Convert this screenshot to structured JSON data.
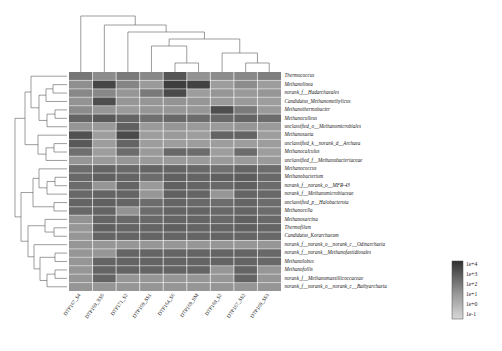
{
  "chart_data": {
    "type": "heatmap",
    "title": "",
    "xlabel": "",
    "ylabel": "",
    "colorscale": {
      "type": "log",
      "low_color": "#d8d8d8",
      "high_color": "#2f2f2f",
      "ticks": [
        "1e+4",
        "1e+3",
        "1e+2",
        "1e+1",
        "1e+0",
        "1e-1"
      ],
      "vmin": 0.1,
      "vmax": 10000
    },
    "legend_position": "bottom-right",
    "grid": true,
    "row_dendrogram": true,
    "column_dendrogram": true,
    "columns": [
      "DTP167_S4",
      "DTP169_XS5",
      "DTP171_S2",
      "DTP169_SS1",
      "DTP164_S6",
      "DTP169_SM",
      "DTP169_S2",
      "DTP167_SS2",
      "DTP169_SS3"
    ],
    "rows": [
      "Thermococcus",
      "Methanolinea",
      "norank_f__Hadarchaeales",
      "Candidatus_Methanomethylicus",
      "Methanothermobacter",
      "Methanoculleus",
      "unclassified_o__Methanomicrobiales",
      "Methanosaeta",
      "unclassified_k__norank_d__Archaea",
      "Methanocalculus",
      "unclassified_f__Methanobacteriaceae",
      "Methanococcus",
      "Methanobacterium",
      "norank_f__norank_o__MFR-43",
      "norank_f__Methanomicrobiaceae",
      "unclassified_p__Halobacterota",
      "Methanocella",
      "Methanosarcina",
      "Thermofilum",
      "Candidatus_Korarchaeum",
      "norank_f__norank_o__norank_c__Odinarchaeia",
      "norank_f__norank__Methanofastidiosales",
      "Methanolobus",
      "Methanofollis",
      "norank_f__Methanomassiliicoccaceae",
      "norank_f__norank_o__norank_c__Bathyarchaeia"
    ],
    "values": [
      [
        2.1,
        1.5,
        2.0,
        1.6,
        3.0,
        1.3,
        1.5,
        1.6,
        1.9
      ],
      [
        1.4,
        3.4,
        1.7,
        1.1,
        3.6,
        3.5,
        1.0,
        1.5,
        1.0
      ],
      [
        1.6,
        1.6,
        1.2,
        2.0,
        3.3,
        1.0,
        1.2,
        1.1,
        1.2
      ],
      [
        1.3,
        3.2,
        1.2,
        1.2,
        1.3,
        1.2,
        1.1,
        1.1,
        1.0
      ],
      [
        1.5,
        1.2,
        1.1,
        1.2,
        1.2,
        1.2,
        3.2,
        2.0,
        1.1
      ],
      [
        2.6,
        2.9,
        2.6,
        2.3,
        2.5,
        2.4,
        2.5,
        2.6,
        2.4
      ],
      [
        1.2,
        1.1,
        2.7,
        1.1,
        1.2,
        1.1,
        1.1,
        1.2,
        1.1
      ],
      [
        3.1,
        1.0,
        3.3,
        1.0,
        1.1,
        1.0,
        2.6,
        2.6,
        1.0
      ],
      [
        2.9,
        1.0,
        2.6,
        1.0,
        1.0,
        1.0,
        1.0,
        1.0,
        1.0
      ],
      [
        2.3,
        1.0,
        2.4,
        1.1,
        2.5,
        2.4,
        1.0,
        2.4,
        1.0
      ],
      [
        1.2,
        1.1,
        1.2,
        1.1,
        1.1,
        1.1,
        1.1,
        1.1,
        1.1
      ],
      [
        2.4,
        2.6,
        2.5,
        2.6,
        2.6,
        2.5,
        2.3,
        2.6,
        2.4
      ],
      [
        2.5,
        2.7,
        2.6,
        2.4,
        2.7,
        2.6,
        2.7,
        2.8,
        2.5
      ],
      [
        2.4,
        1.2,
        2.6,
        1.1,
        2.7,
        2.6,
        2.5,
        2.7,
        2.4
      ],
      [
        2.5,
        2.6,
        2.6,
        1.2,
        2.7,
        2.6,
        1.2,
        2.6,
        2.5
      ],
      [
        2.6,
        2.7,
        2.6,
        2.4,
        2.6,
        2.5,
        2.4,
        2.6,
        2.4
      ],
      [
        2.5,
        2.6,
        1.3,
        2.4,
        2.6,
        2.6,
        2.5,
        2.6,
        2.4
      ],
      [
        1.3,
        2.6,
        2.5,
        2.5,
        2.6,
        2.6,
        2.5,
        2.7,
        2.5
      ],
      [
        1.2,
        2.7,
        2.6,
        2.6,
        2.7,
        2.6,
        2.6,
        2.7,
        2.6
      ],
      [
        1.2,
        2.6,
        2.6,
        2.6,
        2.6,
        2.6,
        2.6,
        2.6,
        2.5
      ],
      [
        1.2,
        1.2,
        1.2,
        1.2,
        1.2,
        1.2,
        1.2,
        1.2,
        1.2
      ],
      [
        1.2,
        1.2,
        2.6,
        2.6,
        2.6,
        2.6,
        2.6,
        2.6,
        2.5
      ],
      [
        1.2,
        2.6,
        2.6,
        2.6,
        2.6,
        2.6,
        2.6,
        2.6,
        2.5
      ],
      [
        1.2,
        2.6,
        2.6,
        2.6,
        2.6,
        2.6,
        1.2,
        2.6,
        1.2
      ],
      [
        1.2,
        2.6,
        1.2,
        1.2,
        1.2,
        1.2,
        1.2,
        2.6,
        1.2
      ],
      [
        1.2,
        1.2,
        1.2,
        1.2,
        1.2,
        1.2,
        1.2,
        1.2,
        1.2
      ]
    ]
  }
}
